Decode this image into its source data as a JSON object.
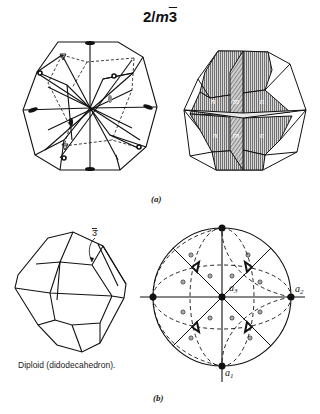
{
  "figure": {
    "title_prefix": "2/",
    "title_m": "m",
    "title_bar3": "3",
    "panel_a": {
      "caption": "(a)",
      "left_drawing": "symmetry-elements-polyhedron",
      "right_drawing": "shaded-face-polyhedron",
      "face_labels": [
        "n",
        "m",
        "n",
        "n",
        "m",
        "n"
      ]
    },
    "panel_b": {
      "caption": "(b)",
      "diploid_label": "Diploid (didodecahedron).",
      "axis_callout": "3̄",
      "stereogram_labels": {
        "a1": "a",
        "a1_sub": "1",
        "a2": "a",
        "a2_sub": "2",
        "a3": "a",
        "a3_sub": "3"
      }
    },
    "colors": {
      "line": "#111111",
      "shade": "#9a9a9a",
      "background": "#ffffff"
    }
  }
}
